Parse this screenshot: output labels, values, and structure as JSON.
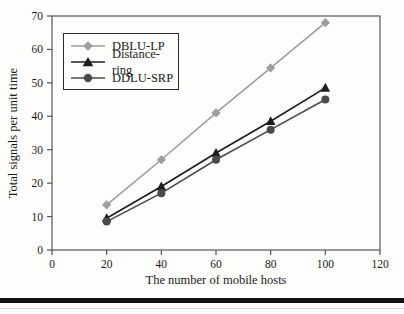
{
  "chart_data": {
    "type": "line",
    "title": "",
    "xlabel": "The number of mobile hosts",
    "ylabel": "Total signals per unit time",
    "xlim": [
      0,
      120
    ],
    "ylim": [
      0,
      70
    ],
    "x_ticks": [
      0,
      20,
      40,
      60,
      80,
      100,
      120
    ],
    "y_ticks": [
      0,
      10,
      20,
      30,
      40,
      50,
      60,
      70
    ],
    "grid": false,
    "legend_position": "top-left-inside",
    "frame_color": "#555555",
    "x": [
      20,
      40,
      60,
      80,
      100
    ],
    "series": [
      {
        "name": "DBLU-LP",
        "marker": "diamond",
        "color": "#9e9e9e",
        "values": [
          13.5,
          27,
          41,
          54.5,
          68
        ]
      },
      {
        "name": "Distance-ring",
        "marker": "triangle",
        "color": "#1c1c1c",
        "values": [
          9.5,
          19,
          29,
          38.5,
          48.5
        ]
      },
      {
        "name": "DDLU-SRP",
        "marker": "circle",
        "color": "#4a4a4a",
        "values": [
          8.5,
          17,
          27,
          36,
          45
        ]
      }
    ]
  },
  "footer": {
    "rule_color": "#111111"
  }
}
